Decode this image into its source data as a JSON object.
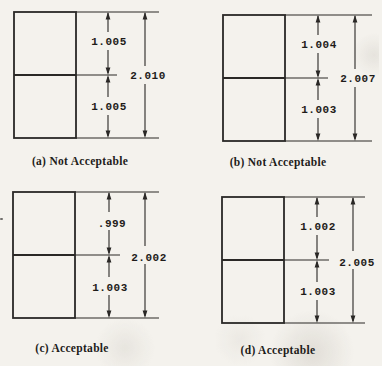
{
  "figure": {
    "colors": {
      "paper": "#f4f2ed",
      "ink": "#2a2826",
      "text": "#1e1c1a"
    },
    "panels": [
      {
        "key": "a",
        "caption": "(a) Not Acceptable",
        "upper_dim": "1.005",
        "lower_dim": "1.005",
        "overall_dim": "2.010"
      },
      {
        "key": "b",
        "caption": "(b) Not Acceptable",
        "upper_dim": "1.004",
        "lower_dim": "1.003",
        "overall_dim": "2.007"
      },
      {
        "key": "c",
        "caption": "(c) Acceptable",
        "upper_dim": ".999",
        "lower_dim": "1.003",
        "overall_dim": "2.002"
      },
      {
        "key": "d",
        "caption": "(d) Acceptable",
        "upper_dim": "1.002",
        "lower_dim": "1.003",
        "overall_dim": "2.005"
      }
    ]
  }
}
